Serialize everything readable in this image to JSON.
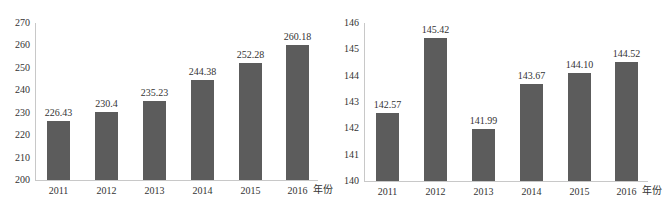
{
  "chart_data": [
    {
      "type": "bar",
      "title": "",
      "xlabel": "年份",
      "ylabel": "",
      "categories": [
        "2011",
        "2012",
        "2013",
        "2014",
        "2015",
        "2016"
      ],
      "values": [
        226.43,
        230.4,
        235.23,
        244.38,
        252.28,
        260.18
      ],
      "value_labels": [
        "226.43",
        "230.4",
        "235.23",
        "244.38",
        "252.28",
        "260.18"
      ],
      "ylim": [
        200,
        270
      ],
      "yticks": [
        "200",
        "210",
        "220",
        "230",
        "240",
        "250",
        "260",
        "270"
      ],
      "grid": false,
      "legend": null,
      "bar_color": "#5c5c5c"
    },
    {
      "type": "bar",
      "title": "",
      "xlabel": "年份",
      "ylabel": "",
      "categories": [
        "2011",
        "2012",
        "2013",
        "2014",
        "2015",
        "2016"
      ],
      "values": [
        142.57,
        145.42,
        141.99,
        143.67,
        144.1,
        144.52
      ],
      "value_labels": [
        "142.57",
        "145.42",
        "141.99",
        "143.67",
        "144.10",
        "144.52"
      ],
      "ylim": [
        140,
        146
      ],
      "yticks": [
        "140",
        "141",
        "142",
        "143",
        "144",
        "145",
        "146"
      ],
      "grid": false,
      "legend": null,
      "bar_color": "#5c5c5c"
    }
  ],
  "layout": {
    "charts": [
      {
        "axis_x": 35,
        "top_y": 23,
        "base_y": 180,
        "axis_end_x": 318,
        "bar_w": 23,
        "bar_x": [
          47,
          95,
          143,
          191,
          239,
          286
        ],
        "unit_x": 313
      },
      {
        "axis_x": 364,
        "top_y": 23,
        "base_y": 181,
        "axis_end_x": 648,
        "bar_w": 23,
        "bar_x": [
          376,
          424,
          472,
          520,
          568,
          615
        ],
        "unit_x": 642
      }
    ]
  }
}
